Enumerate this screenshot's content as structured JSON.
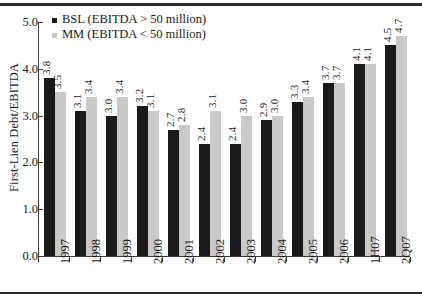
{
  "chart_data": {
    "type": "bar",
    "title": "",
    "xlabel": "",
    "ylabel": "First-Lien Debt/EBITDA",
    "ylim": [
      0.0,
      5.0
    ],
    "ytick_labels": [
      "0.0",
      "1.0",
      "2.0",
      "3.0",
      "4.0",
      "5.0"
    ],
    "ytick_values": [
      0.0,
      1.0,
      2.0,
      3.0,
      4.0,
      5.0
    ],
    "grid": false,
    "legend_position": "top-left",
    "categories": [
      "1997",
      "1998",
      "1999",
      "2000",
      "2001",
      "2002",
      "2003",
      "2004",
      "2005",
      "2006",
      "1H07",
      "2Q07"
    ],
    "series": [
      {
        "name": "BSL (EBITDA > 50 million)",
        "color": "#1a1a1a",
        "values": [
          3.8,
          3.1,
          3.0,
          3.2,
          2.7,
          2.4,
          2.4,
          2.9,
          3.3,
          3.7,
          4.1,
          4.5
        ],
        "labels": [
          "3.8",
          "3.1",
          "3.0",
          "3.2",
          "2.7",
          "2.4",
          "2.4",
          "2.9",
          "3.3",
          "3.7",
          "4.1",
          "4.5"
        ]
      },
      {
        "name": "MM (EBITDA < 50 million)",
        "color": "#c9c9c9",
        "values": [
          3.5,
          3.4,
          3.4,
          3.1,
          2.8,
          3.1,
          3.0,
          3.0,
          3.4,
          3.7,
          4.1,
          4.7
        ],
        "labels": [
          "3.5",
          "3.4",
          "3.4",
          "3.1",
          "2.8",
          "3.1",
          "3.0",
          "3.0",
          "3.4",
          "3.7",
          "4.1",
          "4.7"
        ]
      }
    ]
  },
  "legend": {
    "entries": [
      {
        "label": "BSL (EBITDA > 50 million)",
        "color": "#1a1a1a"
      },
      {
        "label": "MM (EBITDA < 50 million)",
        "color": "#c9c9c9"
      }
    ]
  },
  "axes": {
    "y_title": "First-Lien Debt/EBITDA"
  }
}
